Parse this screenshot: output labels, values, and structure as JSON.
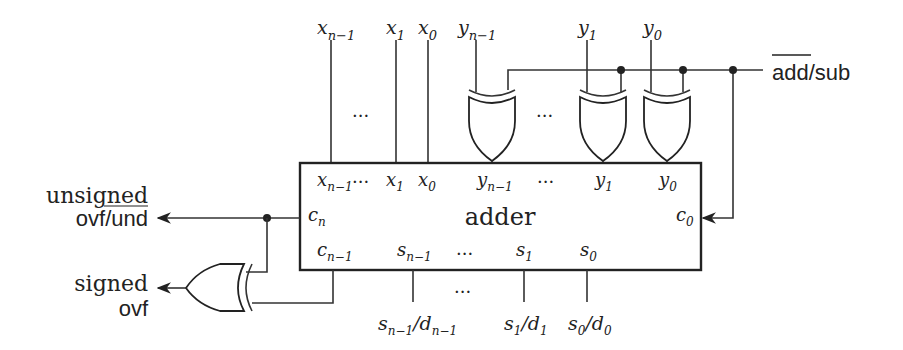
{
  "diagram": {
    "block_label": "adder",
    "inputs_top": {
      "x_nm1": {
        "base": "x",
        "sub": "n−1"
      },
      "x_1": {
        "base": "x",
        "sub": "1"
      },
      "x_0": {
        "base": "x",
        "sub": "0"
      },
      "y_nm1": {
        "base": "y",
        "sub": "n−1"
      },
      "y_1": {
        "base": "y",
        "sub": "1"
      },
      "y_0": {
        "base": "y",
        "sub": "0"
      }
    },
    "ports_in": {
      "x_nm1": {
        "base": "x",
        "sub": "n−1"
      },
      "x_1": {
        "base": "x",
        "sub": "1"
      },
      "x_0": {
        "base": "x",
        "sub": "0"
      },
      "y_nm1": {
        "base": "y",
        "sub": "n−1"
      },
      "y_1": {
        "base": "y",
        "sub": "1"
      },
      "y_0": {
        "base": "y",
        "sub": "0"
      },
      "c_n": {
        "base": "c",
        "sub": "n"
      },
      "c_0": {
        "base": "c",
        "sub": "0"
      },
      "c_nm1": {
        "base": "c",
        "sub": "n−1"
      },
      "s_nm1": {
        "base": "s",
        "sub": "n−1"
      },
      "s_1": {
        "base": "s",
        "sub": "1"
      },
      "s_0": {
        "base": "s",
        "sub": "0"
      }
    },
    "outputs_bottom": {
      "o_nm1": {
        "s": "s",
        "ssub": "n−1",
        "slash": "/",
        "d": "d",
        "dsub": "n−1"
      },
      "o_1": {
        "s": "s",
        "ssub": "1",
        "slash": "/",
        "d": "d",
        "dsub": "1"
      },
      "o_0": {
        "s": "s",
        "ssub": "0",
        "slash": "/",
        "d": "d",
        "dsub": "0"
      }
    },
    "control": {
      "label_add": "add",
      "label_rest": "/sub"
    },
    "left_outputs": {
      "unsigned_top": "unsigned",
      "unsigned_bottom": "ovf/und",
      "signed_top": "signed",
      "signed_bottom": "ovf"
    },
    "ellipsis": "…",
    "dots": "···"
  }
}
